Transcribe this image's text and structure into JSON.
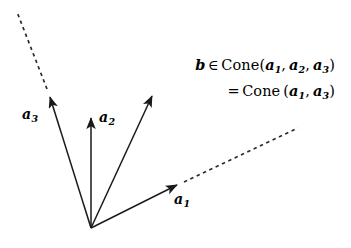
{
  "figure": {
    "background_color": "#ffffff",
    "stroke_color": "#1a1a1a",
    "width": 351,
    "height": 248,
    "origin": {
      "x": 91,
      "y": 228
    }
  },
  "vectors": [
    {
      "id": "a1",
      "label": "a",
      "subscript": "1",
      "label_x": 174,
      "label_y": 192,
      "from": {
        "x": 91,
        "y": 228
      },
      "to": {
        "x": 184,
        "y": 182
      },
      "dashed_extension_to": {
        "x": 298,
        "y": 128
      },
      "has_dashed_extension": true,
      "style": "solid-arrow"
    },
    {
      "id": "a2",
      "label": "a",
      "subscript": "2",
      "label_x": 99,
      "label_y": 110,
      "from": {
        "x": 91,
        "y": 228
      },
      "to": {
        "x": 91,
        "y": 110
      },
      "has_dashed_extension": false,
      "style": "solid-arrow"
    },
    {
      "id": "a3",
      "label": "a",
      "subscript": "3",
      "label_x": 22,
      "label_y": 107,
      "from": {
        "x": 91,
        "y": 228
      },
      "to": {
        "x": 47,
        "y": 89
      },
      "dashed_extension_to": {
        "x": 17,
        "y": 12
      },
      "has_dashed_extension": true,
      "style": "solid-arrow"
    },
    {
      "id": "b",
      "label": "",
      "subscript": "",
      "from": {
        "x": 91,
        "y": 228
      },
      "to": {
        "x": 156,
        "y": 88
      },
      "has_dashed_extension": false,
      "style": "solid-arrow"
    }
  ],
  "annotation": {
    "line1": {
      "vector": "b",
      "membership_symbol": "∈",
      "function_name": "Cone",
      "open_paren": "(",
      "args": [
        {
          "name": "a",
          "sub": "1"
        },
        {
          "name": "a",
          "sub": "2"
        },
        {
          "name": "a",
          "sub": "3"
        }
      ],
      "close_paren": ")",
      "separator": ","
    },
    "line2": {
      "equals_symbol": "=",
      "function_name": "Cone",
      "open_paren": "(",
      "args": [
        {
          "name": "a",
          "sub": "1"
        },
        {
          "name": "a",
          "sub": "3"
        }
      ],
      "close_paren": ")",
      "separator": ","
    }
  }
}
